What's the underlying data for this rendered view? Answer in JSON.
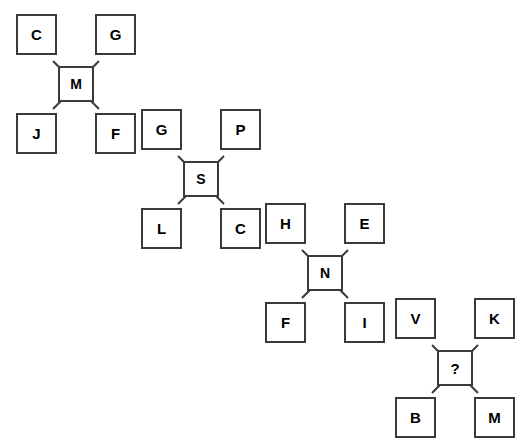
{
  "figure": {
    "background_color": "#ffffff",
    "box_border_color": "#3a3a3a",
    "text_color": "#000000",
    "cluster_count": 4,
    "unknown_marker": "?"
  },
  "clusters": [
    {
      "name": "cluster-1",
      "x": 16,
      "y": 14,
      "top_left": "C",
      "top_right": "G",
      "center": "M",
      "bottom_left": "J",
      "bottom_right": "F"
    },
    {
      "name": "cluster-2",
      "x": 141,
      "y": 109,
      "top_left": "G",
      "top_right": "P",
      "center": "S",
      "bottom_left": "L",
      "bottom_right": "C"
    },
    {
      "name": "cluster-3",
      "x": 265,
      "y": 203,
      "top_left": "H",
      "top_right": "E",
      "center": "N",
      "bottom_left": "F",
      "bottom_right": "I"
    },
    {
      "name": "cluster-4",
      "x": 395,
      "y": 298,
      "top_left": "V",
      "top_right": "K",
      "center": "?",
      "bottom_left": "B",
      "bottom_right": "M"
    }
  ]
}
